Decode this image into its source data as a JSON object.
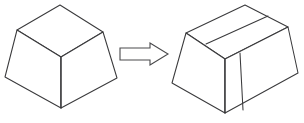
{
  "figure": {
    "background_color": "#ffffff",
    "line_color": "#3a3a3c",
    "fill_color": "#ffffff",
    "width": 304,
    "height": 123,
    "left_shape_label": "truncated-pyramid-solid",
    "right_shape_label": "grooved-truncated-pyramid-solid",
    "arrow_label": "transformation-arrow",
    "left_shape": {
      "name": "frustum",
      "top_face_points": "17,30 60,5 103,32 61,57",
      "front_left_face_points": "17,30 61,57 61,108 5,77",
      "front_right_face_points": "61,57 103,32 117,78 61,108",
      "vertical_edge": "M 61,57 L 61,108"
    },
    "right_shape": {
      "name": "grooved-frustum",
      "top_face_points": "186,33 245,5 288,27 225,59",
      "front_left_face_points": "186,33 225,59 225,113 172,83",
      "front_right_face_points": "225,59 288,27 298,73 225,113",
      "groove_top_line": "M 206,44 L 268,16",
      "groove_edge_left": "M 225,59 L 225,113",
      "groove_edge_right": "M 240,53 L 243,110"
    },
    "arrow": {
      "direction": "right",
      "points": "120,48 150,48 150,43 168,54 150,65 150,60 120,60",
      "color": "#4a4a4c"
    }
  }
}
